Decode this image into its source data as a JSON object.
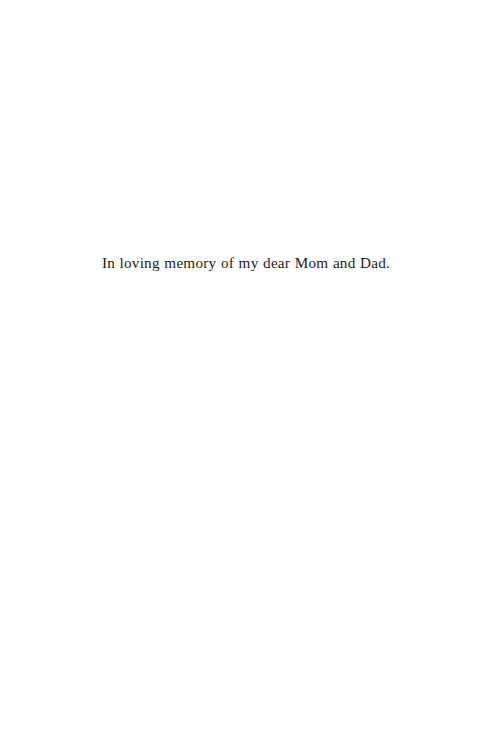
{
  "page": {
    "kind": "book-dedication-page",
    "background_color": "#ffffff",
    "width": 492,
    "height": 754
  },
  "dedication": {
    "text": "In loving memory of my dear Mom and Dad.",
    "text_color": "#1c1a19",
    "alignment": "center"
  }
}
